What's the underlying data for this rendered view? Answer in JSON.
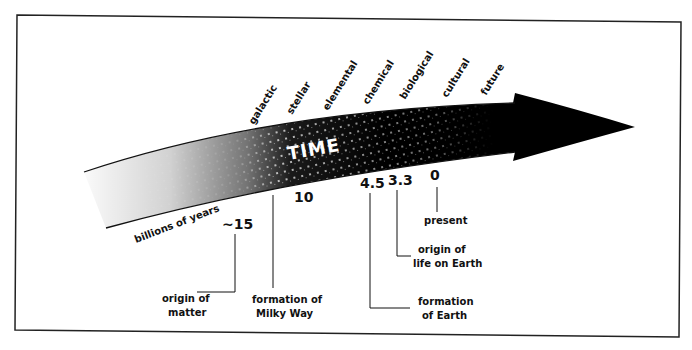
{
  "diagram": {
    "title": "TIME",
    "axis_label": "billions of years",
    "eras": [
      {
        "label": "galactic"
      },
      {
        "label": "stellar"
      },
      {
        "label": "elemental"
      },
      {
        "label": "chemical"
      },
      {
        "label": "biological"
      },
      {
        "label": "cultural"
      },
      {
        "label": "future"
      }
    ],
    "markers": [
      {
        "value": "~15",
        "caption_line1": "origin of",
        "caption_line2": "matter"
      },
      {
        "value": "10",
        "caption_line1": "formation of",
        "caption_line2": "Milky Way"
      },
      {
        "value": "4.5",
        "caption_line1": "formation",
        "caption_line2": "of Earth"
      },
      {
        "value": "3.3",
        "caption_line1": "origin of",
        "caption_line2": "life on Earth"
      },
      {
        "value": "0",
        "caption_line1": "present",
        "caption_line2": ""
      }
    ],
    "colors": {
      "arrow": "#000000",
      "frame": "#222222",
      "background": "#ffffff"
    }
  }
}
